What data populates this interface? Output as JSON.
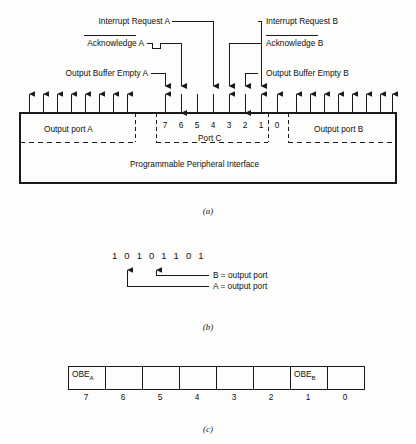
{
  "figure": {
    "panels": [
      {
        "id": "a",
        "caption": "(a)"
      },
      {
        "id": "b",
        "caption": "(b)"
      },
      {
        "id": "c",
        "caption": "(c)"
      }
    ]
  },
  "panel_a": {
    "device_label": "Programmable Peripheral Interface",
    "ports": [
      {
        "name": "Output port A",
        "bits": 8
      },
      {
        "name": "Port C",
        "bits": 8
      },
      {
        "name": "Output port B",
        "bits": 8
      }
    ],
    "port_c_bit_labels": [
      "7",
      "6",
      "5",
      "4",
      "3",
      "2",
      "1",
      "0"
    ],
    "signals_left": [
      {
        "label": "Interrupt Request A",
        "overbar": false,
        "bit": "3"
      },
      {
        "label": "Acknowledge A",
        "overbar": true,
        "overbar_text": "Acknowledge",
        "bit": "6"
      },
      {
        "label": "Output Buffer Empty A",
        "overbar": false,
        "bit": "7"
      }
    ],
    "signals_right": [
      {
        "label": "Interrupt Request B",
        "overbar": false,
        "bit": "0"
      },
      {
        "label": "Acknowledge B",
        "overbar": true,
        "overbar_text": "Acknowledge",
        "bit": "2"
      },
      {
        "label": "Output Buffer Empty B",
        "overbar": false,
        "bit": "1"
      }
    ]
  },
  "panel_b": {
    "binary_word": "1 0 1 0 1 1 0 1",
    "annotations": [
      {
        "text": "B = output port"
      },
      {
        "text": "A = output port"
      }
    ]
  },
  "panel_c": {
    "cells": [
      {
        "bit": "7",
        "text": "OBE",
        "sub": "A"
      },
      {
        "bit": "6",
        "text": "",
        "sub": ""
      },
      {
        "bit": "5",
        "text": "",
        "sub": ""
      },
      {
        "bit": "4",
        "text": "",
        "sub": ""
      },
      {
        "bit": "3",
        "text": "",
        "sub": ""
      },
      {
        "bit": "2",
        "text": "",
        "sub": ""
      },
      {
        "bit": "1",
        "text": "OBE",
        "sub": "B"
      },
      {
        "bit": "0",
        "text": "",
        "sub": ""
      }
    ]
  }
}
